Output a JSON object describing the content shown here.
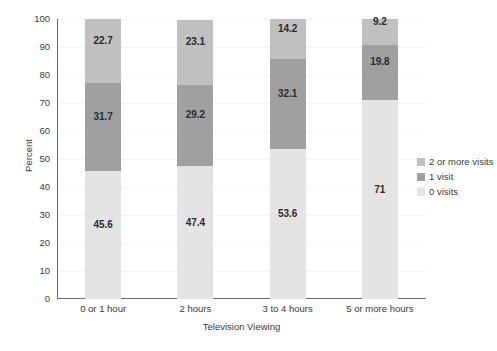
{
  "chart_data": {
    "type": "bar",
    "stacked": true,
    "title": "",
    "xlabel": "Television Viewing",
    "ylabel": "Percent",
    "ylim": [
      0,
      100
    ],
    "ytick_step": 10,
    "yticks": [
      100,
      90,
      80,
      70,
      60,
      50,
      40,
      30,
      20,
      10,
      0
    ],
    "grid": true,
    "grid_axis": "y",
    "legend_position": "right",
    "categories": [
      "0 or 1 hour",
      "2 hours",
      "3 to 4 hours",
      "5 or more hours"
    ],
    "series": [
      {
        "name": "0 visits",
        "color": "#e4e4e4",
        "values": [
          45.6,
          47.4,
          53.6,
          71
        ],
        "labels": [
          "45.6",
          "47.4",
          "53.6",
          "71"
        ]
      },
      {
        "name": "1 visit",
        "color": "#a0a0a0",
        "values": [
          31.7,
          29.2,
          32.1,
          19.8
        ],
        "labels": [
          "31.7",
          "29.2",
          "32.1",
          "19.8"
        ]
      },
      {
        "name": "2 or more visits",
        "color": "#c0c0c0",
        "values": [
          22.7,
          23.1,
          14.2,
          9.2
        ],
        "labels": [
          "22.7",
          "23.1",
          "14.2",
          "9.2"
        ]
      }
    ],
    "legend_entries": [
      {
        "label": "2 or more visits",
        "color": "#c0c0c0"
      },
      {
        "label": "1 visit",
        "color": "#a0a0a0"
      },
      {
        "label": "0 visits",
        "color": "#e4e4e4"
      }
    ]
  }
}
